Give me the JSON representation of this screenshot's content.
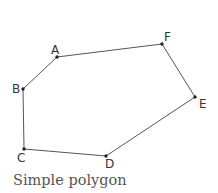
{
  "figure": {
    "caption": "Simple polygon",
    "edge_color": "#555555",
    "vertex_color": "#222222",
    "vertices": [
      {
        "label": "A"
      },
      {
        "label": "F"
      },
      {
        "label": "E"
      },
      {
        "label": "D"
      },
      {
        "label": "C"
      },
      {
        "label": "B"
      }
    ],
    "order": [
      "A",
      "F",
      "E",
      "D",
      "C",
      "B"
    ]
  }
}
